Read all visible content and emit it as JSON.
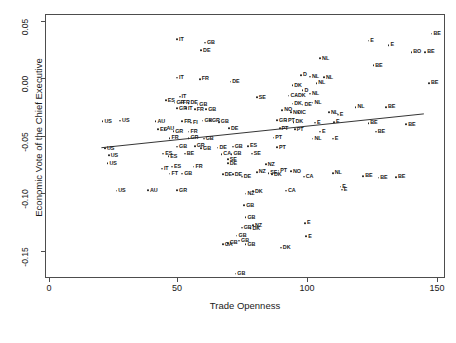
{
  "chart_data": {
    "type": "scatter",
    "title": "",
    "xlabel": "Trade Openness",
    "ylabel": "Economic Vote of the Chief Executive",
    "xlim": [
      -3,
      155
    ],
    "ylim": [
      -0.175,
      0.055
    ],
    "xticks": [
      0,
      50,
      100,
      150
    ],
    "xtick_labels": [
      "0",
      "50",
      "100",
      "150"
    ],
    "yticks": [
      0.05,
      0.0,
      -0.05,
      -0.1,
      -0.15
    ],
    "ytick_labels": [
      "0.05",
      "0.00",
      "-0.05",
      "-0.10",
      "-0.15"
    ],
    "grid": false,
    "legend": false,
    "point_marker": "open-circle",
    "point_label_position": "right",
    "fit_line": {
      "type": "linear-regression",
      "x_start": 19.0,
      "y_start": -0.0615,
      "x_end": 147.0,
      "y_end": -0.0318,
      "color": "#333333"
    },
    "points": [
      {
        "label": "IT",
        "x": 48.5,
        "y": 0.0335
      },
      {
        "label": "GB",
        "x": 59.5,
        "y": 0.0305
      },
      {
        "label": "DE",
        "x": 58.0,
        "y": 0.024
      },
      {
        "label": "BE",
        "x": 149.0,
        "y": 0.0385
      },
      {
        "label": "E",
        "x": 124.0,
        "y": 0.0325
      },
      {
        "label": "E",
        "x": 132.0,
        "y": 0.0285
      },
      {
        "label": "BO",
        "x": 141.0,
        "y": 0.0225
      },
      {
        "label": "BE",
        "x": 146.5,
        "y": 0.0225
      },
      {
        "label": "NL",
        "x": 105.0,
        "y": 0.017
      },
      {
        "label": "BE",
        "x": 126.0,
        "y": 0.011
      },
      {
        "label": "IT",
        "x": 48.5,
        "y": 0.0
      },
      {
        "label": "FR",
        "x": 57.5,
        "y": -0.001
      },
      {
        "label": "DE",
        "x": 69.5,
        "y": -0.0035
      },
      {
        "label": "D",
        "x": 97.5,
        "y": 0.0025
      },
      {
        "label": "NL",
        "x": 101.0,
        "y": 0.001
      },
      {
        "label": "NL",
        "x": 106.5,
        "y": 0.0005
      },
      {
        "label": "NL",
        "x": 103.5,
        "y": -0.0045
      },
      {
        "label": "BE",
        "x": 148.0,
        "y": -0.0045
      },
      {
        "label": "DK",
        "x": 94.0,
        "y": -0.0065
      },
      {
        "label": "D",
        "x": 98.0,
        "y": -0.011
      },
      {
        "label": "IT",
        "x": 49.5,
        "y": -0.0165
      },
      {
        "label": "ES",
        "x": 44.0,
        "y": -0.0195
      },
      {
        "label": "NL",
        "x": 101.0,
        "y": -0.014
      },
      {
        "label": "CA",
        "x": 92.5,
        "y": -0.0155
      },
      {
        "label": "DK",
        "x": 95.5,
        "y": -0.0155
      },
      {
        "label": "SE",
        "x": 80.0,
        "y": -0.017
      },
      {
        "label": "GR",
        "x": 47.5,
        "y": -0.0215
      },
      {
        "label": "FR",
        "x": 50.0,
        "y": -0.0215
      },
      {
        "label": "DE",
        "x": 53.0,
        "y": -0.022
      },
      {
        "label": "GB",
        "x": 56.5,
        "y": -0.0235
      },
      {
        "label": "DK",
        "x": 94.0,
        "y": -0.0225
      },
      {
        "label": "DE",
        "x": 98.0,
        "y": -0.0235
      },
      {
        "label": "NL",
        "x": 102.0,
        "y": -0.0215
      },
      {
        "label": "NL",
        "x": 119.0,
        "y": -0.0255
      },
      {
        "label": "BE",
        "x": 131.0,
        "y": -0.0255
      },
      {
        "label": "GR",
        "x": 48.5,
        "y": -0.0265
      },
      {
        "label": "IT",
        "x": 52.0,
        "y": -0.0265
      },
      {
        "label": "FR",
        "x": 55.5,
        "y": -0.0275
      },
      {
        "label": "GB",
        "x": 60.0,
        "y": -0.0275
      },
      {
        "label": "NO",
        "x": 90.0,
        "y": -0.028
      },
      {
        "label": "NO",
        "x": 93.5,
        "y": -0.03
      },
      {
        "label": "IC",
        "x": 96.5,
        "y": -0.03
      },
      {
        "label": "NL",
        "x": 108.5,
        "y": -0.03
      },
      {
        "label": "E",
        "x": 112.0,
        "y": -0.032
      },
      {
        "label": "US",
        "x": 19.0,
        "y": -0.038
      },
      {
        "label": "US",
        "x": 26.0,
        "y": -0.0375
      },
      {
        "label": "AU",
        "x": 40.0,
        "y": -0.038
      },
      {
        "label": "FR",
        "x": 50.5,
        "y": -0.038
      },
      {
        "label": "FI",
        "x": 54.0,
        "y": -0.039
      },
      {
        "label": "GB",
        "x": 58.5,
        "y": -0.0375
      },
      {
        "label": "GR",
        "x": 61.5,
        "y": -0.037
      },
      {
        "label": "GB",
        "x": 65.0,
        "y": -0.0385
      },
      {
        "label": "GR",
        "x": 88.0,
        "y": -0.037
      },
      {
        "label": "PT",
        "x": 91.5,
        "y": -0.0375
      },
      {
        "label": "DK",
        "x": 94.5,
        "y": -0.0385
      },
      {
        "label": "E",
        "x": 103.0,
        "y": -0.039
      },
      {
        "label": "E",
        "x": 110.5,
        "y": -0.0385
      },
      {
        "label": "BE",
        "x": 124.0,
        "y": -0.0395
      },
      {
        "label": "BE",
        "x": 139.0,
        "y": -0.0405
      },
      {
        "label": "ES",
        "x": 41.0,
        "y": -0.045
      },
      {
        "label": "AU",
        "x": 43.5,
        "y": -0.0445
      },
      {
        "label": "GR",
        "x": 47.0,
        "y": -0.0465
      },
      {
        "label": "FR",
        "x": 53.0,
        "y": -0.047
      },
      {
        "label": "DE",
        "x": 69.0,
        "y": -0.044
      },
      {
        "label": "PT",
        "x": 89.0,
        "y": -0.044
      },
      {
        "label": "PT",
        "x": 95.0,
        "y": -0.045
      },
      {
        "label": "E",
        "x": 105.0,
        "y": -0.047
      },
      {
        "label": "BE",
        "x": 127.0,
        "y": -0.047
      },
      {
        "label": "FR",
        "x": 45.5,
        "y": -0.0525
      },
      {
        "label": "GR",
        "x": 53.0,
        "y": -0.0525
      },
      {
        "label": "GB",
        "x": 59.0,
        "y": -0.053
      },
      {
        "label": "PT",
        "x": 86.5,
        "y": -0.052
      },
      {
        "label": "NL",
        "x": 102.0,
        "y": -0.053
      },
      {
        "label": "E",
        "x": 110.0,
        "y": -0.053
      },
      {
        "label": "US",
        "x": 20.0,
        "y": -0.0615
      },
      {
        "label": "GB",
        "x": 48.5,
        "y": -0.06
      },
      {
        "label": "GR",
        "x": 55.5,
        "y": -0.0595
      },
      {
        "label": "GB",
        "x": 58.0,
        "y": -0.0615
      },
      {
        "label": "DE",
        "x": 64.5,
        "y": -0.061
      },
      {
        "label": "GB",
        "x": 70.5,
        "y": -0.06
      },
      {
        "label": "ES",
        "x": 76.5,
        "y": -0.0595
      },
      {
        "label": "PT",
        "x": 88.0,
        "y": -0.0605
      },
      {
        "label": "US",
        "x": 21.5,
        "y": -0.0675
      },
      {
        "label": "ES",
        "x": 43.0,
        "y": -0.066
      },
      {
        "label": "ES",
        "x": 45.0,
        "y": -0.0685
      },
      {
        "label": "BE",
        "x": 51.5,
        "y": -0.066
      },
      {
        "label": "CA",
        "x": 66.0,
        "y": -0.0665
      },
      {
        "label": "GB",
        "x": 70.0,
        "y": -0.0665
      },
      {
        "label": "SE",
        "x": 78.0,
        "y": -0.066
      },
      {
        "label": "SE",
        "x": 68.5,
        "y": -0.071
      },
      {
        "label": "US",
        "x": 21.0,
        "y": -0.0745
      },
      {
        "label": "IT",
        "x": 42.5,
        "y": -0.079
      },
      {
        "label": "ES",
        "x": 46.5,
        "y": -0.0775
      },
      {
        "label": "FR",
        "x": 55.0,
        "y": -0.0775
      },
      {
        "label": "DE",
        "x": 68.5,
        "y": -0.0745
      },
      {
        "label": "NZ",
        "x": 83.5,
        "y": -0.0755
      },
      {
        "label": "FT",
        "x": 45.5,
        "y": -0.0835
      },
      {
        "label": "GB",
        "x": 50.5,
        "y": -0.0835
      },
      {
        "label": "DE",
        "x": 66.5,
        "y": -0.084
      },
      {
        "label": "DE",
        "x": 70.5,
        "y": -0.084
      },
      {
        "label": "DE",
        "x": 74.0,
        "y": -0.086
      },
      {
        "label": "DK",
        "x": 86.0,
        "y": -0.084
      },
      {
        "label": "NZ",
        "x": 80.0,
        "y": -0.082
      },
      {
        "label": "PT",
        "x": 88.5,
        "y": -0.081
      },
      {
        "label": "SE",
        "x": 84.5,
        "y": -0.083
      },
      {
        "label": "NO",
        "x": 93.5,
        "y": -0.0815
      },
      {
        "label": "NL",
        "x": 110.0,
        "y": -0.083
      },
      {
        "label": "US",
        "x": 24.5,
        "y": -0.0985
      },
      {
        "label": "AU",
        "x": 37.0,
        "y": -0.098
      },
      {
        "label": "GR",
        "x": 48.5,
        "y": -0.098
      },
      {
        "label": "NZ",
        "x": 75.5,
        "y": -0.101
      },
      {
        "label": "CA",
        "x": 98.5,
        "y": -0.086
      },
      {
        "label": "BE",
        "x": 122.0,
        "y": -0.0855
      },
      {
        "label": "BE",
        "x": 128.0,
        "y": -0.087
      },
      {
        "label": "BE",
        "x": 135.0,
        "y": -0.0865
      },
      {
        "label": "DK",
        "x": 78.5,
        "y": -0.099
      },
      {
        "label": "CA",
        "x": 91.5,
        "y": -0.0985
      },
      {
        "label": "E",
        "x": 113.0,
        "y": -0.095
      },
      {
        "label": "E",
        "x": 113.5,
        "y": -0.0975
      },
      {
        "label": "GB",
        "x": 75.0,
        "y": -0.111
      },
      {
        "label": "GB",
        "x": 75.5,
        "y": -0.1215
      },
      {
        "label": "GB",
        "x": 74.0,
        "y": -0.1305
      },
      {
        "label": "NZ",
        "x": 78.5,
        "y": -0.1285
      },
      {
        "label": "DK",
        "x": 77.5,
        "y": -0.131
      },
      {
        "label": "GB",
        "x": 72.0,
        "y": -0.1375
      },
      {
        "label": "GB",
        "x": 73.0,
        "y": -0.142
      },
      {
        "label": "GB",
        "x": 68.5,
        "y": -0.144
      },
      {
        "label": "GA",
        "x": 66.5,
        "y": -0.145
      },
      {
        "label": "GB",
        "x": 75.5,
        "y": -0.145
      },
      {
        "label": "DK",
        "x": 89.5,
        "y": -0.148
      },
      {
        "label": "E",
        "x": 99.0,
        "y": -0.1265
      },
      {
        "label": "E",
        "x": 99.5,
        "y": -0.138
      },
      {
        "label": "GB",
        "x": 71.5,
        "y": -0.1705
      }
    ]
  }
}
